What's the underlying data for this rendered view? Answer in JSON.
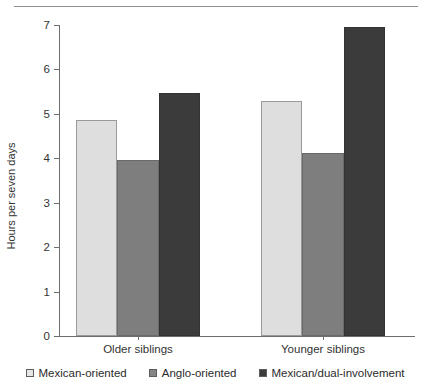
{
  "chart_data": {
    "type": "bar",
    "title": "",
    "xlabel": "",
    "ylabel": "Hours per seven days",
    "ylim": [
      0,
      7
    ],
    "ytick_labels": [
      "0",
      "1",
      "2",
      "3",
      "4",
      "5",
      "6",
      "7"
    ],
    "ytick_values": [
      0,
      1,
      2,
      3,
      4,
      5,
      6,
      7
    ],
    "grid": false,
    "legend_position": "bottom",
    "categories": [
      "Older siblings",
      "Younger siblings"
    ],
    "series": [
      {
        "name": "Mexican-oriented",
        "color": "#dedede",
        "values": [
          4.87,
          5.3
        ]
      },
      {
        "name": "Anglo-oriented",
        "color": "#7e7e7e",
        "values": [
          3.97,
          4.12
        ]
      },
      {
        "name": "Mexican/dual-involvement",
        "color": "#3b3b3b",
        "values": [
          5.46,
          6.95
        ]
      }
    ]
  },
  "legend": {
    "items": [
      {
        "label": "Mexican-oriented",
        "swatch": "light"
      },
      {
        "label": "Anglo-oriented",
        "swatch": "mid"
      },
      {
        "label": "Mexican/dual-involvement",
        "swatch": "dark"
      }
    ]
  }
}
